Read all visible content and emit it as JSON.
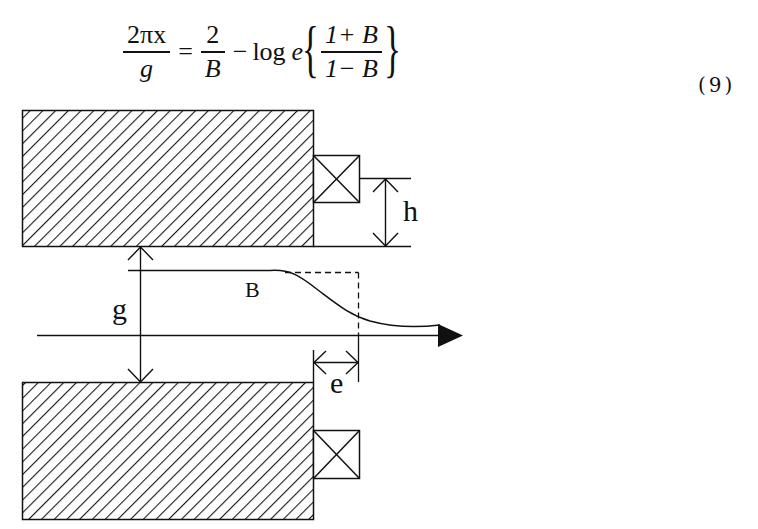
{
  "equation": {
    "lhs_numerator": "2πx",
    "lhs_denominator": "g",
    "equals": "=",
    "term1_numerator": "2",
    "term1_denominator": "B",
    "minus": "−",
    "log_text": "log",
    "log_base": "e",
    "brace_open": "{",
    "brace_close": "}",
    "arg_numerator": "1+ B",
    "arg_denominator": "1− B",
    "number": "(9)"
  },
  "diagram": {
    "labels": {
      "h": "h",
      "g": "g",
      "B": "B",
      "e": "e"
    },
    "colors": {
      "stroke": "#111111",
      "hatch": "#1a1a1a",
      "background": "#ffffff"
    },
    "elements": [
      "top-pole-piece (hatched)",
      "bottom-pole-piece (hatched)",
      "top-coil (boxed X)",
      "bottom-coil (boxed X)",
      "dimension h",
      "dimension g",
      "dimension e",
      "field profile curve B",
      "ideal step (dashed)",
      "axis arrow"
    ]
  }
}
